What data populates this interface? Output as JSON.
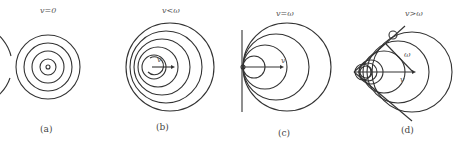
{
  "panels": [
    {
      "id": "a",
      "condition": "v=0",
      "caption": "(a)"
    },
    {
      "id": "b",
      "condition": "v<ω",
      "caption": "(b)",
      "velocity_label": "v"
    },
    {
      "id": "c",
      "condition": "v=ω",
      "caption": "(c)",
      "velocity_label": "v"
    },
    {
      "id": "d",
      "condition": "v>ω",
      "caption": "(d)",
      "velocity_label": "v",
      "wave_speed_label": "ω"
    }
  ],
  "colors": {
    "line": "#333333",
    "text": "#555555"
  }
}
